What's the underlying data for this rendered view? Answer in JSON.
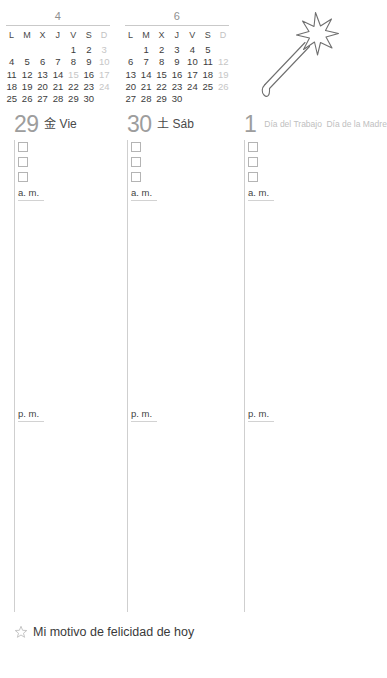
{
  "mini_calendars": [
    {
      "month_label": "4",
      "weekday_headers": [
        "L",
        "M",
        "X",
        "J",
        "V",
        "S",
        "D"
      ],
      "weeks": [
        [
          {
            "d": "",
            "dim": false,
            "empty": true
          },
          {
            "d": "",
            "dim": false,
            "empty": true
          },
          {
            "d": "",
            "dim": false,
            "empty": true
          },
          {
            "d": "",
            "dim": false,
            "empty": true
          },
          {
            "d": "1",
            "dim": false,
            "empty": false
          },
          {
            "d": "2",
            "dim": false,
            "empty": false
          },
          {
            "d": "3",
            "dim": true,
            "empty": false
          }
        ],
        [
          {
            "d": "4",
            "dim": false,
            "empty": false
          },
          {
            "d": "5",
            "dim": false,
            "empty": false
          },
          {
            "d": "6",
            "dim": false,
            "empty": false
          },
          {
            "d": "7",
            "dim": false,
            "empty": false
          },
          {
            "d": "8",
            "dim": false,
            "empty": false
          },
          {
            "d": "9",
            "dim": false,
            "empty": false
          },
          {
            "d": "10",
            "dim": true,
            "empty": false
          }
        ],
        [
          {
            "d": "11",
            "dim": false,
            "empty": false
          },
          {
            "d": "12",
            "dim": false,
            "empty": false
          },
          {
            "d": "13",
            "dim": false,
            "empty": false
          },
          {
            "d": "14",
            "dim": false,
            "empty": false
          },
          {
            "d": "15",
            "dim": true,
            "empty": false
          },
          {
            "d": "16",
            "dim": false,
            "empty": false
          },
          {
            "d": "17",
            "dim": true,
            "empty": false
          }
        ],
        [
          {
            "d": "18",
            "dim": false,
            "empty": false
          },
          {
            "d": "19",
            "dim": false,
            "empty": false
          },
          {
            "d": "20",
            "dim": false,
            "empty": false
          },
          {
            "d": "21",
            "dim": false,
            "empty": false
          },
          {
            "d": "22",
            "dim": false,
            "empty": false
          },
          {
            "d": "23",
            "dim": false,
            "empty": false
          },
          {
            "d": "24",
            "dim": true,
            "empty": false
          }
        ],
        [
          {
            "d": "25",
            "dim": false,
            "empty": false
          },
          {
            "d": "26",
            "dim": false,
            "empty": false
          },
          {
            "d": "27",
            "dim": false,
            "empty": false
          },
          {
            "d": "28",
            "dim": false,
            "empty": false
          },
          {
            "d": "29",
            "dim": false,
            "empty": false
          },
          {
            "d": "30",
            "dim": false,
            "empty": false
          },
          {
            "d": "",
            "dim": false,
            "empty": true
          }
        ]
      ]
    },
    {
      "month_label": "6",
      "weekday_headers": [
        "L",
        "M",
        "X",
        "J",
        "V",
        "S",
        "D"
      ],
      "weeks": [
        [
          {
            "d": "",
            "dim": false,
            "empty": true
          },
          {
            "d": "1",
            "dim": false,
            "empty": false
          },
          {
            "d": "2",
            "dim": false,
            "empty": false
          },
          {
            "d": "3",
            "dim": false,
            "empty": false
          },
          {
            "d": "4",
            "dim": false,
            "empty": false
          },
          {
            "d": "5",
            "dim": false,
            "empty": false
          },
          {
            "d": "",
            "dim": false,
            "empty": true
          }
        ],
        [
          {
            "d": "6",
            "dim": false,
            "empty": false
          },
          {
            "d": "7",
            "dim": false,
            "empty": false
          },
          {
            "d": "8",
            "dim": false,
            "empty": false
          },
          {
            "d": "9",
            "dim": false,
            "empty": false
          },
          {
            "d": "10",
            "dim": false,
            "empty": false
          },
          {
            "d": "11",
            "dim": false,
            "empty": false
          },
          {
            "d": "12",
            "dim": true,
            "empty": false
          }
        ],
        [
          {
            "d": "13",
            "dim": false,
            "empty": false
          },
          {
            "d": "14",
            "dim": false,
            "empty": false
          },
          {
            "d": "15",
            "dim": false,
            "empty": false
          },
          {
            "d": "16",
            "dim": false,
            "empty": false
          },
          {
            "d": "17",
            "dim": false,
            "empty": false
          },
          {
            "d": "18",
            "dim": false,
            "empty": false
          },
          {
            "d": "19",
            "dim": true,
            "empty": false
          }
        ],
        [
          {
            "d": "20",
            "dim": false,
            "empty": false
          },
          {
            "d": "21",
            "dim": false,
            "empty": false
          },
          {
            "d": "22",
            "dim": false,
            "empty": false
          },
          {
            "d": "23",
            "dim": false,
            "empty": false
          },
          {
            "d": "24",
            "dim": false,
            "empty": false
          },
          {
            "d": "25",
            "dim": false,
            "empty": false
          },
          {
            "d": "26",
            "dim": true,
            "empty": false
          }
        ],
        [
          {
            "d": "27",
            "dim": false,
            "empty": false
          },
          {
            "d": "28",
            "dim": false,
            "empty": false
          },
          {
            "d": "29",
            "dim": false,
            "empty": false
          },
          {
            "d": "30",
            "dim": false,
            "empty": false
          },
          {
            "d": "",
            "dim": false,
            "empty": true
          },
          {
            "d": "",
            "dim": false,
            "empty": true
          },
          {
            "d": "",
            "dim": false,
            "empty": true
          }
        ]
      ]
    }
  ],
  "illustration": {
    "name": "magic-wand"
  },
  "days": [
    {
      "number": "29",
      "kanji": "金",
      "abbrev": "Vie",
      "holidays": [],
      "checkbox_count": 3,
      "am_label": "a. m.",
      "pm_label": "p. m."
    },
    {
      "number": "30",
      "kanji": "土",
      "abbrev": "Sáb",
      "holidays": [],
      "checkbox_count": 3,
      "am_label": "a. m.",
      "pm_label": "p. m."
    },
    {
      "number": "1",
      "kanji": "",
      "abbrev": "",
      "holidays": [
        "Día del Trabajo",
        "Día de la Madre"
      ],
      "checkbox_count": 3,
      "am_label": "a. m.",
      "pm_label": "p. m."
    }
  ],
  "footer": {
    "star_icon": "star-outline-icon",
    "text": "Mi motivo de felicidad de hoy"
  },
  "colors": {
    "rule": "#c9c9c9",
    "day_number": "#9d9d9d",
    "dim_day": "#c6c6c6",
    "text": "#3a3a3a",
    "holiday_text": "#c0c0c0"
  }
}
